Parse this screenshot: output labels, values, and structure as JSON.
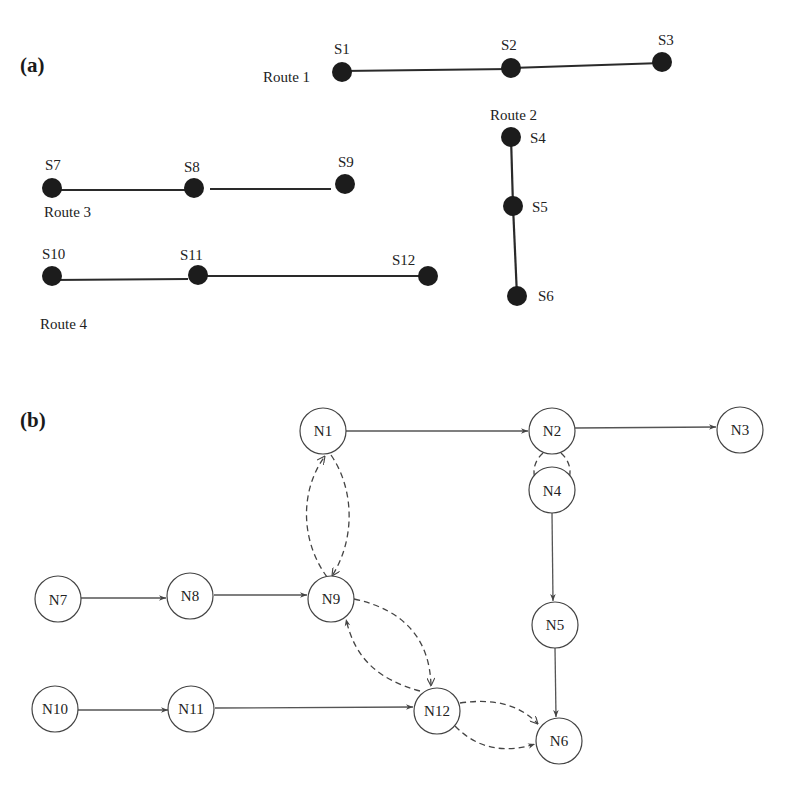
{
  "panel_a": {
    "label": "(a)",
    "routes": [
      {
        "name": "Route 1",
        "stops": [
          "S1",
          "S2",
          "S3"
        ]
      },
      {
        "name": "Route 2",
        "stops": [
          "S4",
          "S5",
          "S6"
        ]
      },
      {
        "name": "Route 3",
        "stops": [
          "S7",
          "S8",
          "S9"
        ]
      },
      {
        "name": "Route 4",
        "stops": [
          "S10",
          "S11",
          "S12"
        ]
      }
    ],
    "stops": {
      "S1": "S1",
      "S2": "S2",
      "S3": "S3",
      "S4": "S4",
      "S5": "S5",
      "S6": "S6",
      "S7": "S7",
      "S8": "S8",
      "S9": "S9",
      "S10": "S10",
      "S11": "S11",
      "S12": "S12"
    },
    "route_labels": {
      "r1": "Route 1",
      "r2": "Route 2",
      "r3": "Route 3",
      "r4": "Route 4"
    }
  },
  "panel_b": {
    "label": "(b)",
    "nodes": {
      "N1": "N1",
      "N2": "N2",
      "N3": "N3",
      "N4": "N4",
      "N5": "N5",
      "N6": "N6",
      "N7": "N7",
      "N8": "N8",
      "N9": "N9",
      "N10": "N10",
      "N11": "N11",
      "N12": "N12"
    },
    "solid_edges": [
      [
        "N1",
        "N2"
      ],
      [
        "N2",
        "N3"
      ],
      [
        "N4",
        "N5"
      ],
      [
        "N5",
        "N6"
      ],
      [
        "N7",
        "N8"
      ],
      [
        "N8",
        "N9"
      ],
      [
        "N10",
        "N11"
      ],
      [
        "N11",
        "N12"
      ]
    ],
    "dashed_edges": [
      [
        "N1",
        "N9"
      ],
      [
        "N9",
        "N1"
      ],
      [
        "N2",
        "N4"
      ],
      [
        "N2",
        "N4"
      ],
      [
        "N9",
        "N12"
      ],
      [
        "N12",
        "N9"
      ],
      [
        "N12",
        "N6"
      ],
      [
        "N12",
        "N6"
      ]
    ]
  }
}
